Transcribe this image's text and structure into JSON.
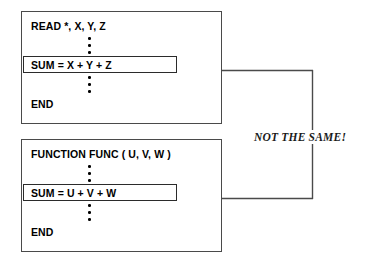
{
  "diagram": {
    "background_color": "#ffffff",
    "line_color": "#4a4a4a",
    "text_color": "#000000"
  },
  "blocks": [
    {
      "id": "read-block",
      "header": "READ *, X, Y, Z",
      "highlighted_statement": "SUM = X + Y + Z",
      "footer": "END",
      "ellipsis_above": "⋮",
      "ellipsis_below": "⋮"
    },
    {
      "id": "func-block",
      "header": "FUNCTION FUNC ( U, V, W )",
      "highlighted_statement": "SUM = U + V + W",
      "footer": "END",
      "ellipsis_above": "⋮",
      "ellipsis_below": "⋮"
    }
  ],
  "annotation": {
    "label": "NOT THE SAME!"
  },
  "connector": {
    "description": "elbow connector with arrowheads into both SUM statements",
    "arrow_color": "#4a4a4a"
  }
}
